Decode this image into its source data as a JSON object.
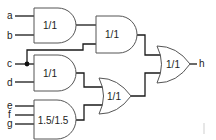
{
  "diagram": {
    "type": "logic-circuit",
    "inputs": [
      {
        "id": "a",
        "label": "a"
      },
      {
        "id": "b",
        "label": "b"
      },
      {
        "id": "c",
        "label": "c"
      },
      {
        "id": "d",
        "label": "d"
      },
      {
        "id": "e",
        "label": "e"
      },
      {
        "id": "f",
        "label": "f"
      },
      {
        "id": "g",
        "label": "g"
      }
    ],
    "output": {
      "id": "h",
      "label": "h"
    },
    "gates": [
      {
        "id": "and1",
        "type": "AND",
        "label": "1/1",
        "inputs": [
          "a",
          "b"
        ]
      },
      {
        "id": "and2",
        "type": "AND",
        "label": "1/1",
        "inputs": [
          "and1",
          "c"
        ]
      },
      {
        "id": "and3",
        "type": "AND",
        "label": "1/1",
        "inputs": [
          "c",
          "d"
        ]
      },
      {
        "id": "and4",
        "type": "AND",
        "label": "1.5/1.5",
        "inputs": [
          "e",
          "f",
          "g"
        ]
      },
      {
        "id": "or1",
        "type": "OR",
        "label": "1/1",
        "inputs": [
          "and3",
          "and4"
        ]
      },
      {
        "id": "or2",
        "type": "OR",
        "label": "1/1",
        "inputs": [
          "and2",
          "or1"
        ]
      }
    ],
    "colors": {
      "wire": "#1a1a1a",
      "gate_stroke": "#555555",
      "background": "#ffffff"
    }
  }
}
